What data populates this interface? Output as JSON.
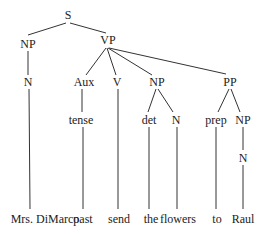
{
  "diagram": {
    "type": "syntax-tree",
    "line_color": "#333333",
    "text_color": "#222222",
    "nodes": [
      {
        "id": "S",
        "label": "S",
        "x": 68,
        "y": 15
      },
      {
        "id": "NP1",
        "label": "NP",
        "x": 28,
        "y": 44
      },
      {
        "id": "VP",
        "label": "VP",
        "x": 108,
        "y": 40
      },
      {
        "id": "N1",
        "label": "N",
        "x": 28,
        "y": 82
      },
      {
        "id": "Aux",
        "label": "Aux",
        "x": 84,
        "y": 82
      },
      {
        "id": "V",
        "label": "V",
        "x": 117,
        "y": 82
      },
      {
        "id": "NP2",
        "label": "NP",
        "x": 157,
        "y": 82
      },
      {
        "id": "PP",
        "label": "PP",
        "x": 230,
        "y": 82
      },
      {
        "id": "tense",
        "label": "tense",
        "x": 81,
        "y": 120
      },
      {
        "id": "det",
        "label": "det",
        "x": 149,
        "y": 120
      },
      {
        "id": "N2",
        "label": "N",
        "x": 176,
        "y": 120
      },
      {
        "id": "prep",
        "label": "prep",
        "x": 216,
        "y": 120
      },
      {
        "id": "NP3",
        "label": "NP",
        "x": 243,
        "y": 120
      },
      {
        "id": "N3",
        "label": "N",
        "x": 243,
        "y": 158
      },
      {
        "id": "w1",
        "label": "Mrs. DiMarco",
        "x": 45,
        "y": 219
      },
      {
        "id": "w2",
        "label": "past",
        "x": 83,
        "y": 219
      },
      {
        "id": "w3",
        "label": "send",
        "x": 119,
        "y": 219
      },
      {
        "id": "w4",
        "label": "the",
        "x": 151,
        "y": 219
      },
      {
        "id": "w5",
        "label": "flowers",
        "x": 178,
        "y": 219
      },
      {
        "id": "w6",
        "label": "to",
        "x": 217,
        "y": 219
      },
      {
        "id": "w7",
        "label": "Raul",
        "x": 243,
        "y": 219
      }
    ],
    "edges": [
      {
        "from": "S",
        "to": "NP1",
        "x1": 66,
        "y1": 23,
        "x2": 28,
        "y2": 35
      },
      {
        "from": "S",
        "to": "VP",
        "x1": 70,
        "y1": 23,
        "x2": 106,
        "y2": 33
      },
      {
        "from": "NP1",
        "to": "N1",
        "x1": 28,
        "y1": 51,
        "x2": 28,
        "y2": 75
      },
      {
        "from": "VP",
        "to": "Aux",
        "x1": 106,
        "y1": 48,
        "x2": 86,
        "y2": 75
      },
      {
        "from": "VP",
        "to": "V",
        "x1": 107,
        "y1": 48,
        "x2": 116,
        "y2": 75
      },
      {
        "from": "VP",
        "to": "NP2",
        "x1": 108,
        "y1": 48,
        "x2": 152,
        "y2": 75
      },
      {
        "from": "VP",
        "to": "PP",
        "x1": 109,
        "y1": 48,
        "x2": 226,
        "y2": 74
      },
      {
        "from": "N1",
        "to": "w1",
        "x1": 29,
        "y1": 89,
        "x2": 30,
        "y2": 209
      },
      {
        "from": "Aux",
        "to": "tense",
        "x1": 82,
        "y1": 89,
        "x2": 82,
        "y2": 112
      },
      {
        "from": "V",
        "to": "w3",
        "x1": 118,
        "y1": 89,
        "x2": 118,
        "y2": 209
      },
      {
        "from": "NP2",
        "to": "det",
        "x1": 156,
        "y1": 89,
        "x2": 148,
        "y2": 112
      },
      {
        "from": "NP2",
        "to": "N2",
        "x1": 158,
        "y1": 89,
        "x2": 173,
        "y2": 112
      },
      {
        "from": "PP",
        "to": "prep",
        "x1": 229,
        "y1": 89,
        "x2": 218,
        "y2": 112
      },
      {
        "from": "PP",
        "to": "NP3",
        "x1": 231,
        "y1": 89,
        "x2": 240,
        "y2": 112
      },
      {
        "from": "tense",
        "to": "w2",
        "x1": 83,
        "y1": 127,
        "x2": 83,
        "y2": 209
      },
      {
        "from": "det",
        "to": "w4",
        "x1": 149,
        "y1": 127,
        "x2": 149,
        "y2": 209
      },
      {
        "from": "N2",
        "to": "w5",
        "x1": 177,
        "y1": 127,
        "x2": 177,
        "y2": 209
      },
      {
        "from": "prep",
        "to": "w6",
        "x1": 216,
        "y1": 127,
        "x2": 216,
        "y2": 209
      },
      {
        "from": "NP3",
        "to": "N3",
        "x1": 243,
        "y1": 127,
        "x2": 243,
        "y2": 150
      },
      {
        "from": "N3",
        "to": "w7",
        "x1": 243,
        "y1": 165,
        "x2": 243,
        "y2": 209
      }
    ]
  }
}
